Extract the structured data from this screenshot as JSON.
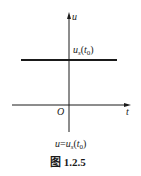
{
  "figure": {
    "caption": "图 1.2.5",
    "equation": {
      "lhs": "u",
      "eq": "=",
      "rhs_main": "u",
      "rhs_sub": "s",
      "rhs_arg_open": "(",
      "rhs_arg_var": "t",
      "rhs_arg_sub": "0",
      "rhs_arg_close": ")"
    },
    "axes": {
      "y_label": "u",
      "x_label": "t",
      "origin_label": "O"
    },
    "line_label": {
      "main": "u",
      "sub": "s",
      "open": "(",
      "var": "t",
      "var_sub": "0",
      "close": ")"
    },
    "colors": {
      "ink": "#1a1a1a",
      "background": "#ffffff"
    }
  }
}
